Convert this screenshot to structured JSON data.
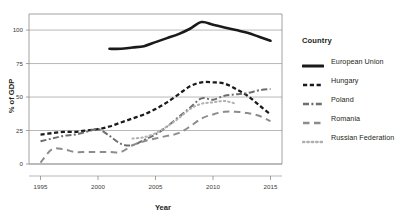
{
  "chart_data": {
    "type": "line",
    "title": "",
    "xlabel": "Year",
    "ylabel": "% of GDP",
    "xlim": [
      1994,
      2016
    ],
    "ylim": [
      0,
      112
    ],
    "xticks": [
      1995,
      2000,
      2005,
      2010,
      2015
    ],
    "yticks": [
      0,
      25,
      50,
      75,
      100
    ],
    "grid": "horizontal",
    "legend_position": "right",
    "legend_title": "Country",
    "series": [
      {
        "name": "European Union",
        "style": "solid",
        "color": "#1a1a1a",
        "x": [
          2001,
          2002,
          2003,
          2004,
          2005,
          2006,
          2007,
          2008,
          2009,
          2010,
          2011,
          2012,
          2013,
          2014,
          2015
        ],
        "values": [
          86,
          86,
          87,
          88,
          91,
          94,
          97,
          101,
          106,
          104,
          102,
          100,
          98,
          95,
          92
        ]
      },
      {
        "name": "Hungary",
        "style": "dashed",
        "color": "#1a1a1a",
        "x": [
          1995,
          1996,
          1997,
          1998,
          1999,
          2000,
          2001,
          2002,
          2003,
          2004,
          2005,
          2006,
          2007,
          2008,
          2009,
          2010,
          2011,
          2012,
          2013,
          2014,
          2015
        ],
        "values": [
          22,
          23,
          24,
          24,
          25,
          26,
          28,
          31,
          34,
          37,
          41,
          46,
          52,
          58,
          61,
          61,
          60,
          56,
          51,
          44,
          37
        ]
      },
      {
        "name": "Poland",
        "style": "dashdot",
        "color": "#6e6e6e",
        "x": [
          1995,
          1996,
          1997,
          1998,
          1999,
          2000,
          2001,
          2002,
          2003,
          2004,
          2005,
          2006,
          2007,
          2008,
          2009,
          2010,
          2011,
          2012,
          2013,
          2014,
          2015
        ],
        "values": [
          17,
          19,
          21,
          22,
          24,
          26,
          21,
          15,
          14,
          18,
          22,
          28,
          35,
          42,
          49,
          48,
          51,
          52,
          53,
          55,
          56
        ]
      },
      {
        "name": "Romania",
        "style": "longdash",
        "color": "#8c8c8c",
        "x": [
          1995,
          1996,
          1997,
          1998,
          1999,
          2000,
          2001,
          2002,
          2003,
          2004,
          2005,
          2006,
          2007,
          2008,
          2009,
          2010,
          2011,
          2012,
          2013,
          2014,
          2015
        ],
        "values": [
          1,
          11,
          11,
          9,
          9,
          9,
          9,
          9,
          14,
          17,
          19,
          21,
          23,
          28,
          34,
          37,
          39,
          39,
          38,
          36,
          32
        ]
      },
      {
        "name": "Russian Federation",
        "style": "dotted",
        "color": "#b0b0b0",
        "x": [
          2003,
          2004,
          2005,
          2006,
          2007,
          2008,
          2009,
          2010,
          2011,
          2012
        ],
        "values": [
          19,
          20,
          23,
          28,
          34,
          41,
          45,
          46,
          47,
          45
        ]
      }
    ]
  },
  "legend": {
    "title": "Country",
    "items": [
      {
        "label": "European Union",
        "key": "line-key-solid"
      },
      {
        "label": "Hungary",
        "key": "line-key-dashed"
      },
      {
        "label": "Poland",
        "key": "line-key-dashdot"
      },
      {
        "label": "Romania",
        "key": "line-key-longdash"
      },
      {
        "label": "Russian Federation",
        "key": "line-key-dotted"
      }
    ]
  }
}
